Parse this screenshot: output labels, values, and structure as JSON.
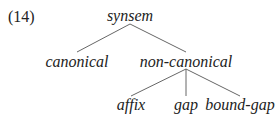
{
  "example_number": "(14)",
  "tree": {
    "root": "synsem",
    "level1": [
      "canonical",
      "non-canonical"
    ],
    "level2": [
      "affix",
      "gap",
      "bound-gap"
    ]
  }
}
